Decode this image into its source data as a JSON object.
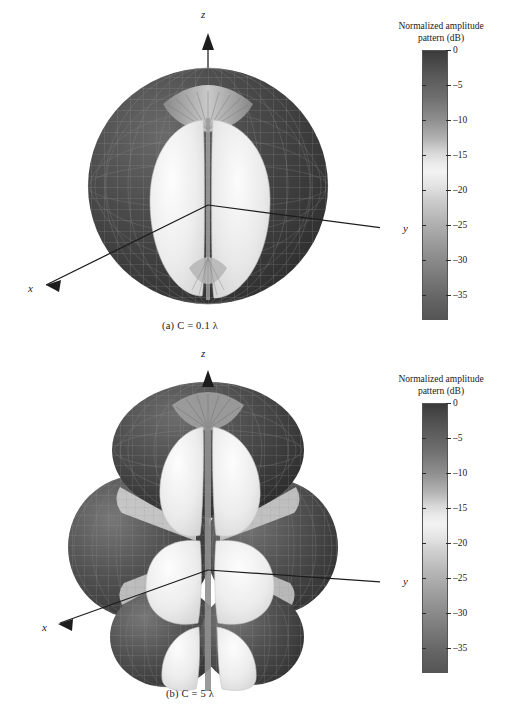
{
  "figure": {
    "type": "antenna-radiation-pattern-figure",
    "panels": [
      {
        "id": "a",
        "caption": "(a) C = 0.1 λ",
        "caption_label": "(a)",
        "caption_symbol": "C",
        "caption_value": "= 0.1 λ",
        "pattern_description": "single-lobe toroidal pattern",
        "axes": {
          "x": "x",
          "y": "y",
          "z": "z"
        },
        "colorbar": {
          "title_line1": "Normalized amplitude",
          "title_line2": "pattern (dB)",
          "ticks": [
            "0",
            "–5",
            "–10",
            "–15",
            "–20",
            "–25",
            "–30",
            "–35"
          ],
          "tick_values": [
            0,
            -5,
            -10,
            -15,
            -20,
            -25,
            -30,
            -35
          ],
          "min": -38,
          "max": 0,
          "units": "dB"
        }
      },
      {
        "id": "b",
        "caption": "(b) C = 5 λ",
        "caption_label": "(b)",
        "caption_symbol": "C",
        "caption_value": "= 5 λ",
        "pattern_description": "multi-lobe pattern with six major lobes",
        "axes": {
          "x": "x",
          "y": "y",
          "z": "z"
        },
        "colorbar": {
          "title_line1": "Normalized amplitude",
          "title_line2": "pattern (dB)",
          "ticks": [
            "0",
            "–5",
            "–10",
            "–15",
            "–20",
            "–25",
            "–30",
            "–35"
          ],
          "tick_values": [
            0,
            -5,
            -10,
            -15,
            -20,
            -25,
            -30,
            -35
          ],
          "min": -38,
          "max": 0,
          "units": "dB"
        }
      }
    ],
    "colors": {
      "background": "#ffffff",
      "ink": "#1a1a1a",
      "mesh_dark": "#3a3a3a",
      "lobe_light": "#ececec",
      "cb_dark": "#3b3b3b",
      "cb_light": "#f2f2f2"
    }
  }
}
